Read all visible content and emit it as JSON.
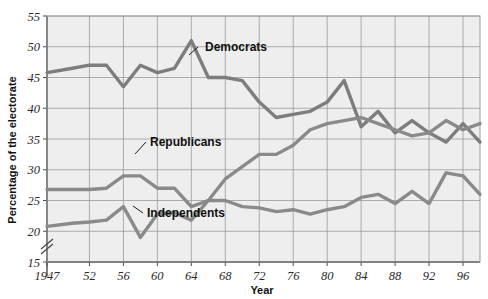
{
  "chart_data": {
    "type": "line",
    "title": "",
    "xlabel": "Year",
    "ylabel": "Percentage of the electorate",
    "xlim": [
      1947,
      1998
    ],
    "ylim": [
      15,
      55
    ],
    "ytick_values": [
      55,
      50,
      45,
      40,
      35,
      30,
      25,
      20,
      15
    ],
    "ytick_labels": [
      "55",
      "50",
      "45",
      "40",
      "35",
      "30",
      "25",
      "20",
      "15"
    ],
    "xtick_values": [
      1947,
      1952,
      1956,
      1960,
      1964,
      1968,
      1972,
      1976,
      1980,
      1984,
      1988,
      1992,
      1996
    ],
    "xtick_labels": [
      "1947",
      "52",
      "56",
      "60",
      "64",
      "68",
      "72",
      "76",
      "80",
      "84",
      "88",
      "92",
      "96"
    ],
    "grid": true,
    "axis_break": true,
    "axis_break_symbol": "//",
    "legend_position": "inline-annotations",
    "plot_bg": "#eeeeee",
    "grid_color": "#9a9a9a",
    "axis_color": "#4a4a4a",
    "series": [
      {
        "name": "Democrats",
        "color": "#7d7d7d",
        "label_anchor_year": 1966,
        "x": [
          1947,
          1950,
          1952,
          1954,
          1956,
          1958,
          1960,
          1962,
          1964,
          1966,
          1968,
          1970,
          1972,
          1974,
          1976,
          1978,
          1980,
          1982,
          1984,
          1986,
          1988,
          1990,
          1992,
          1994,
          1996,
          1998
        ],
        "values": [
          45.8,
          46.5,
          47.0,
          47.0,
          43.5,
          47.0,
          45.8,
          46.5,
          51.0,
          45.0,
          45.0,
          44.5,
          41.0,
          38.5,
          39.0,
          39.5,
          41.0,
          44.5,
          37.0,
          39.5,
          36.0,
          38.0,
          36.0,
          34.5,
          37.5,
          34.5
        ]
      },
      {
        "name": "Republicans",
        "color": "#8a8a8a",
        "label_anchor_year": 1958,
        "x": [
          1947,
          1950,
          1952,
          1954,
          1956,
          1958,
          1960,
          1962,
          1964,
          1966,
          1968,
          1970,
          1972,
          1974,
          1976,
          1978,
          1980,
          1982,
          1984,
          1986,
          1988,
          1990,
          1992,
          1994,
          1996,
          1998
        ],
        "values": [
          26.8,
          26.8,
          26.8,
          27.0,
          29.0,
          29.0,
          27.0,
          27.0,
          24.0,
          25.0,
          28.5,
          30.5,
          32.5,
          32.5,
          34.0,
          36.5,
          37.5,
          38.0,
          38.5,
          37.5,
          36.5,
          35.5,
          36.0,
          38.0,
          36.5,
          37.5
        ]
      },
      {
        "name": "Independents",
        "color": "#8a8a8a",
        "label_anchor_year": 1959,
        "x": [
          1947,
          1950,
          1952,
          1954,
          1956,
          1958,
          1960,
          1962,
          1964,
          1966,
          1968,
          1970,
          1972,
          1974,
          1976,
          1978,
          1980,
          1982,
          1984,
          1986,
          1988,
          1990,
          1992,
          1994,
          1996,
          1998
        ],
        "values": [
          20.8,
          21.3,
          21.5,
          21.8,
          24.0,
          19.0,
          22.8,
          23.0,
          21.8,
          25.0,
          25.0,
          24.0,
          23.8,
          23.2,
          23.5,
          22.8,
          23.5,
          24.0,
          25.5,
          26.0,
          24.5,
          26.5,
          24.5,
          29.5,
          29.0,
          26.0
        ]
      }
    ]
  }
}
